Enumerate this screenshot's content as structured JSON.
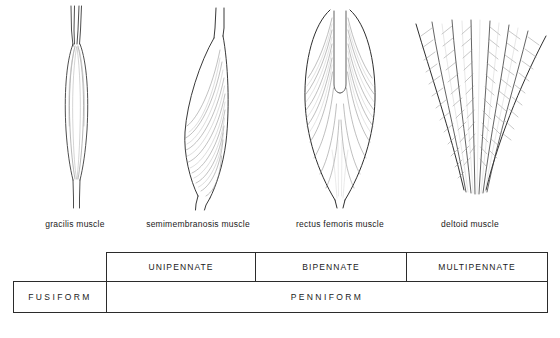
{
  "figures": [
    {
      "id": "gracilis",
      "label": "gracilis muscle",
      "icon": "fusiform-muscle-icon",
      "architecture": "fusiform"
    },
    {
      "id": "semimembranosis",
      "label": "semimembranosis muscle",
      "icon": "unipennate-muscle-icon",
      "architecture": "unipennate"
    },
    {
      "id": "rectus",
      "label": "rectus femoris muscle",
      "icon": "bipennate-muscle-icon",
      "architecture": "bipennate"
    },
    {
      "id": "deltoid",
      "label": "deltoid muscle",
      "icon": "multipennate-muscle-icon",
      "architecture": "multipennate"
    }
  ],
  "table": {
    "upper_row": [
      {
        "id": "unipennate",
        "label": "UNIPENNATE"
      },
      {
        "id": "bipennate",
        "label": "BIPENNATE"
      },
      {
        "id": "multipennate",
        "label": "MULTIPENNATE"
      }
    ],
    "lower_row": [
      {
        "id": "fusiform",
        "label": "FUSIFORM"
      },
      {
        "id": "penniform",
        "label": "PENNIFORM"
      }
    ]
  },
  "colors": {
    "ink": "#1b1b1b",
    "rule": "#2b2b2b",
    "background": "#ffffff",
    "drawing": "#3a3a3a"
  }
}
